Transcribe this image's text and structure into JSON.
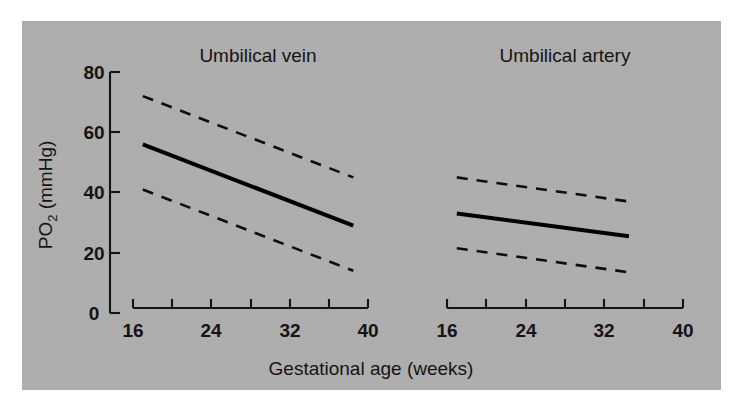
{
  "figure": {
    "background_color": "#b0b0b0",
    "page_color": "#ffffff",
    "line_color": "#000000"
  },
  "axes": {
    "x_label": "Gestational age (weeks)",
    "y_label_main": "PO",
    "y_label_sub": "2",
    "y_label_unit": " (mmHg)",
    "y_label_full": "PO2 (mmHg)",
    "x_ticklabels": [
      "16",
      "24",
      "32",
      "40"
    ],
    "y_ticklabels": [
      "0",
      "20",
      "40",
      "60",
      "80"
    ]
  },
  "panels": {
    "left_title": "Umbilical vein",
    "right_title": "Umbilical artery"
  },
  "chart_data": {
    "type": "line",
    "title": "",
    "xlabel": "Gestational age (weeks)",
    "ylabel": "PO2 (mmHg)",
    "xlim": [
      16,
      40
    ],
    "ylim": [
      0,
      80
    ],
    "xticks": [
      16,
      20,
      24,
      28,
      32,
      36,
      40
    ],
    "xticklabels": [
      "16",
      "",
      "24",
      "",
      "32",
      "",
      "40"
    ],
    "yticks": [
      0,
      20,
      40,
      60,
      80
    ],
    "yticklabels": [
      "0",
      "20",
      "40",
      "60",
      "80"
    ],
    "grid": false,
    "legend": "none",
    "panels": [
      {
        "title": "Umbilical vein",
        "x": [
          17,
          38.5
        ],
        "series": [
          {
            "name": "Upper reference limit",
            "style": "dashed",
            "values": [
              72,
              45
            ]
          },
          {
            "name": "Median",
            "style": "solid",
            "values": [
              56,
              29
            ]
          },
          {
            "name": "Lower reference limit",
            "style": "dashed",
            "values": [
              41,
              14
            ]
          }
        ]
      },
      {
        "title": "Umbilical artery",
        "x": [
          17,
          34.5
        ],
        "series": [
          {
            "name": "Upper reference limit",
            "style": "dashed",
            "values": [
              45,
              37
            ]
          },
          {
            "name": "Median",
            "style": "solid",
            "values": [
              33,
              25.5
            ]
          },
          {
            "name": "Lower reference limit",
            "style": "dashed",
            "values": [
              21.5,
              13.5
            ]
          }
        ]
      }
    ]
  }
}
